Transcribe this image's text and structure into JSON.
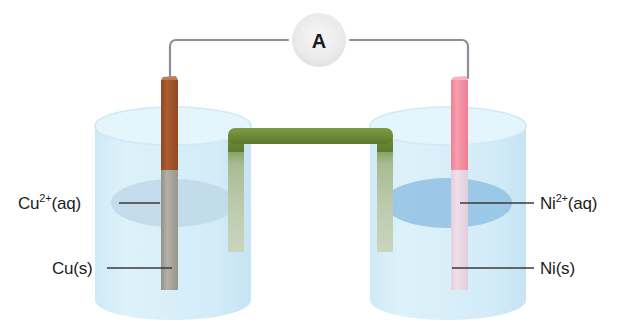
{
  "diagram": {
    "type": "electrochemical-cell-diagram"
  },
  "meter": {
    "symbol": "A",
    "name": "ammeter",
    "circle_color": "#ededed"
  },
  "wire": {
    "color": "#8a8f99",
    "name": "external-circuit-wire"
  },
  "salt_bridge": {
    "name": "salt-bridge",
    "color_exposed": "#6f8c3a",
    "color_submerged": "#b8c6a8"
  },
  "left_cell": {
    "beaker_name": "left-beaker",
    "solution_color": "#d4eef8",
    "surface_color": "#c2dced",
    "electrode": {
      "name": "copper-electrode",
      "color_exposed": "#a0522d",
      "color_submerged": "#a8a59c"
    },
    "labels": {
      "solution_base": "Cu",
      "solution_sup": "2+",
      "solution_tail": "(aq)",
      "electrode": "Cu(s)"
    }
  },
  "right_cell": {
    "beaker_name": "right-beaker",
    "solution_color": "#d4eef8",
    "surface_color": "#9ec9e8",
    "electrode": {
      "name": "nickel-electrode",
      "color_exposed": "#f4879b",
      "color_submerged": "#ebd6e4"
    },
    "labels": {
      "solution_base": "Ni",
      "solution_sup": "2+",
      "solution_tail": "(aq)",
      "electrode": "Ni(s)"
    }
  },
  "leader_lines": {
    "color": "#3a3a3a"
  }
}
